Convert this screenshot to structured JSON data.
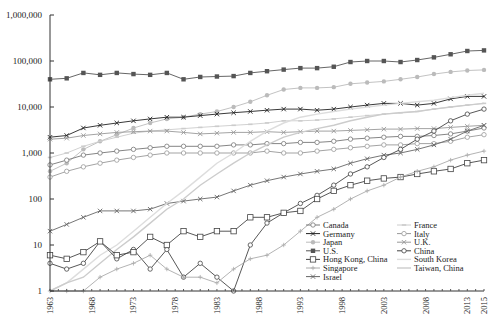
{
  "chart_data": {
    "type": "line",
    "title": "",
    "xlabel": "",
    "ylabel": "",
    "yscale": "log",
    "ylim": [
      1,
      1000000
    ],
    "xlim": [
      1963,
      2015
    ],
    "grid": false,
    "legend_position": "lower right (inside plot)",
    "y_ticks": [
      "1",
      "10",
      "100",
      "1,000",
      "10,000",
      "100,000",
      "1,000,000"
    ],
    "x_ticks": [
      "1963",
      "1968",
      "1973",
      "1978",
      "1983",
      "1988",
      "1993",
      "1998",
      "2003",
      "2008",
      "2013",
      "2015"
    ],
    "x": [
      1963,
      1965,
      1967,
      1969,
      1971,
      1973,
      1975,
      1977,
      1979,
      1981,
      1983,
      1985,
      1987,
      1989,
      1991,
      1993,
      1995,
      1997,
      1999,
      2001,
      2003,
      2005,
      2007,
      2009,
      2011,
      2013,
      2015
    ],
    "series": [
      {
        "name": "U.S.",
        "color": "#555555",
        "marker": "square-filled",
        "values": [
          40000,
          42000,
          55000,
          50000,
          55000,
          52000,
          50000,
          55000,
          40000,
          45000,
          46000,
          47000,
          55000,
          60000,
          65000,
          70000,
          70000,
          75000,
          95000,
          100000,
          100000,
          95000,
          105000,
          120000,
          140000,
          165000,
          170000
        ]
      },
      {
        "name": "Japan",
        "color": "#bbbbbb",
        "marker": "circle-filled",
        "values": [
          400,
          600,
          1200,
          1800,
          2500,
          3500,
          4500,
          5500,
          6000,
          7000,
          8000,
          10000,
          13000,
          18000,
          24000,
          26000,
          26000,
          27000,
          32000,
          34000,
          36000,
          40000,
          45000,
          52000,
          58000,
          62000,
          64000
        ]
      },
      {
        "name": "Germany",
        "color": "#222222",
        "marker": "x",
        "values": [
          2200,
          2400,
          3500,
          4000,
          4500,
          5000,
          5500,
          6000,
          6000,
          6500,
          7000,
          7500,
          8000,
          8500,
          9000,
          9000,
          8500,
          9000,
          10000,
          11000,
          12000,
          12000,
          11000,
          12000,
          15000,
          17000,
          17000
        ]
      },
      {
        "name": "France",
        "color": "#cccccc",
        "marker": "dash",
        "values": [
          800,
          1000,
          1400,
          1800,
          2200,
          2700,
          3000,
          3200,
          3400,
          3600,
          3800,
          4000,
          4200,
          4500,
          5000,
          5000,
          5200,
          5500,
          6000,
          6500,
          7000,
          7500,
          8000,
          9000,
          10000,
          11000,
          12000
        ]
      },
      {
        "name": "Canada",
        "color": "#777777",
        "marker": "circle-open",
        "values": [
          550,
          700,
          900,
          1000,
          1100,
          1200,
          1300,
          1400,
          1400,
          1400,
          1400,
          1500,
          1500,
          1600,
          1600,
          1700,
          1700,
          1800,
          2000,
          2100,
          2200,
          2300,
          2300,
          2400,
          2600,
          3000,
          3500
        ]
      },
      {
        "name": "U.K.",
        "color": "#999999",
        "marker": "x",
        "values": [
          2000,
          2100,
          2400,
          2600,
          2800,
          2900,
          3000,
          3000,
          2800,
          2600,
          2700,
          2800,
          2800,
          2900,
          2800,
          2900,
          3000,
          3000,
          3100,
          3200,
          3300,
          3300,
          3400,
          3400,
          3600,
          3800,
          4000
        ]
      },
      {
        "name": "Italy",
        "color": "#999999",
        "marker": "circle-open",
        "values": [
          300,
          400,
          500,
          600,
          700,
          800,
          900,
          1000,
          1000,
          1000,
          1000,
          1000,
          1000,
          1100,
          1000,
          1000,
          1100,
          1200,
          1300,
          1400,
          1500,
          1500,
          1600,
          1600,
          1800,
          2200,
          2500
        ]
      },
      {
        "name": "Israel",
        "color": "#666666",
        "marker": "x",
        "values": [
          20,
          28,
          40,
          55,
          55,
          55,
          60,
          80,
          90,
          100,
          110,
          150,
          200,
          250,
          300,
          350,
          400,
          450,
          600,
          750,
          900,
          1000,
          1200,
          1500,
          2000,
          3000,
          4000
        ]
      },
      {
        "name": "South Korea",
        "color": "#dddddd",
        "marker": "none",
        "values": [
          1,
          1.5,
          3,
          6,
          10,
          20,
          40,
          80,
          150,
          300,
          600,
          1000,
          1800,
          3000,
          4500,
          6000,
          7000,
          8000,
          9000,
          10000,
          11000,
          12000,
          13000,
          14000,
          16000,
          18000,
          20000
        ]
      },
      {
        "name": "Taiwan, China",
        "color": "#cccccc",
        "marker": "none",
        "values": [
          1,
          1.5,
          2,
          4,
          8,
          15,
          30,
          60,
          100,
          200,
          350,
          600,
          1000,
          1500,
          2200,
          2800,
          3400,
          4000,
          5000,
          6000,
          7000,
          7500,
          8000,
          9000,
          10000,
          11000,
          12000
        ]
      },
      {
        "name": "China",
        "color": "#444444",
        "marker": "circle-open",
        "values": [
          4,
          3,
          4,
          12,
          5,
          8,
          3,
          8,
          2,
          4,
          2,
          1,
          10,
          30,
          50,
          80,
          120,
          200,
          350,
          500,
          800,
          1200,
          2000,
          3000,
          5000,
          7000,
          9000
        ]
      },
      {
        "name": "Hong Kong, China",
        "color": "#444444",
        "marker": "square-open",
        "values": [
          6,
          5,
          7,
          12,
          6,
          7,
          15,
          10,
          20,
          15,
          20,
          20,
          40,
          40,
          50,
          55,
          100,
          150,
          200,
          250,
          280,
          300,
          350,
          400,
          450,
          600,
          700
        ]
      },
      {
        "name": "Singapore",
        "color": "#aaaaaa",
        "marker": "plus",
        "values": [
          1,
          1,
          1,
          2,
          3,
          4,
          6,
          3,
          2,
          2,
          1.5,
          3,
          5,
          6,
          10,
          20,
          40,
          60,
          100,
          150,
          200,
          300,
          400,
          500,
          700,
          900,
          1100
        ]
      }
    ]
  },
  "axes": {
    "y_labels": [
      "1,000,000",
      "100,000",
      "10,000",
      "1,000",
      "100",
      "10",
      "1"
    ],
    "x_labels": [
      "1963",
      "1968",
      "1973",
      "1978",
      "1983",
      "1988",
      "1993",
      "1998",
      "2003",
      "2008",
      "2013",
      "2015"
    ]
  },
  "legend": {
    "left": [
      "Canada",
      "Germany",
      "Japan",
      "U.S.",
      "Hong Kong, China",
      "Singapore",
      "Israel"
    ],
    "right": [
      "France",
      "Italy",
      "U.K.",
      "China",
      "South Korea",
      "Taiwan, China"
    ]
  }
}
